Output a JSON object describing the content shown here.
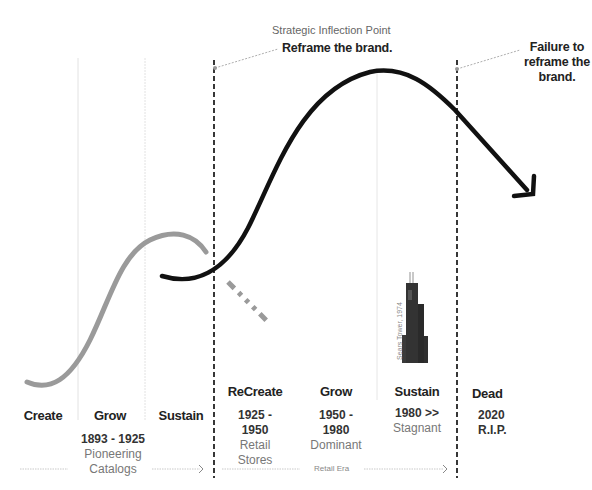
{
  "annotations": {
    "inflection_title": "Strategic Inflection Point",
    "inflection_action": "Reframe the brand.",
    "failure_line1": "Failure to",
    "failure_line2": "reframe the",
    "failure_line3": "brand."
  },
  "phases": [
    {
      "label": "Create"
    },
    {
      "label": "Grow",
      "years": "1893 - 1925",
      "desc_line1": "Pioneering",
      "desc_line2": "Catalogs"
    },
    {
      "label": "Sustain"
    },
    {
      "label": "ReCreate",
      "years_line1": "1925 -",
      "years_line2": "1950",
      "desc_line1": "Retail",
      "desc_line2": "Stores"
    },
    {
      "label": "Grow",
      "years_line1": "1950 -",
      "years_line2": "1980",
      "desc_line1": "Dominant"
    },
    {
      "label": "Sustain",
      "years_line1": "1980 >>",
      "desc_line1": "Stagnant"
    },
    {
      "label": "Dead",
      "years_line1": "2020",
      "years_line2": "R.I.P."
    }
  ],
  "eras": {
    "retail_era": "Retail Era"
  },
  "tower": {
    "label": "Sears Tower, 1974",
    "icon": "skyscraper-icon"
  },
  "colors": {
    "first_curve": "#9a9a9a",
    "second_curve": "#111111",
    "divider": "#222222",
    "faint_divider": "#dddddd"
  }
}
